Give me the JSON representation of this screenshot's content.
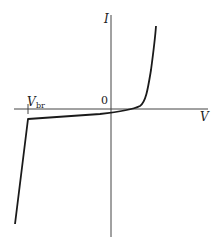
{
  "diagram": {
    "axes": {
      "x_label": "V",
      "y_label": "I",
      "origin_label": "0"
    },
    "annotations": {
      "breakdown_label_main": "V",
      "breakdown_label_sub": "br"
    },
    "colors": {
      "axis": "#333333",
      "curve": "#1a1a1a",
      "background": "#ffffff"
    }
  }
}
